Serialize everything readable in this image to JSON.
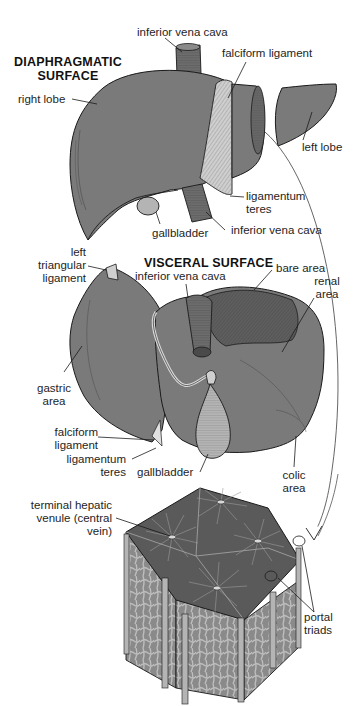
{
  "colors": {
    "liver": "#7a7a7a",
    "liver_dark": "#5e5e5e",
    "ligament": "#c8c8c8",
    "vessel": "#6c6c6c",
    "gallbladder": "#b4b4b4",
    "background": "#ffffff"
  },
  "diaphragmatic": {
    "title_line1": "DIAPHRAGMATIC",
    "title_line2": "SURFACE",
    "labels": {
      "ivc_top": "inferior vena cava",
      "falciform": "falciform ligament",
      "right_lobe": "right lobe",
      "left_lobe": "left lobe",
      "lig_teres_1": "ligamentum",
      "lig_teres_2": "teres",
      "gallbladder": "gallbladder",
      "ivc_bottom": "inferior vena cava"
    }
  },
  "visceral": {
    "title": "VISCERAL SURFACE",
    "labels": {
      "left_tri_1": "left",
      "left_tri_2": "triangular",
      "left_tri_3": "ligament",
      "ivc": "inferior vena cava",
      "bare_area": "bare area",
      "renal_1": "renal",
      "renal_2": "area",
      "gastric_1": "gastric",
      "gastric_2": "area",
      "falciform_1": "falciform",
      "falciform_2": "ligament",
      "lig_teres_1": "ligamentum",
      "lig_teres_2": "teres",
      "gallbladder": "gallbladder",
      "colic_1": "colic",
      "colic_2": "area"
    }
  },
  "lobule": {
    "labels": {
      "central_1": "terminal hepatic",
      "central_2": "venule (central",
      "central_3": "vein)",
      "portal_1": "portal",
      "portal_2": "triads"
    }
  }
}
